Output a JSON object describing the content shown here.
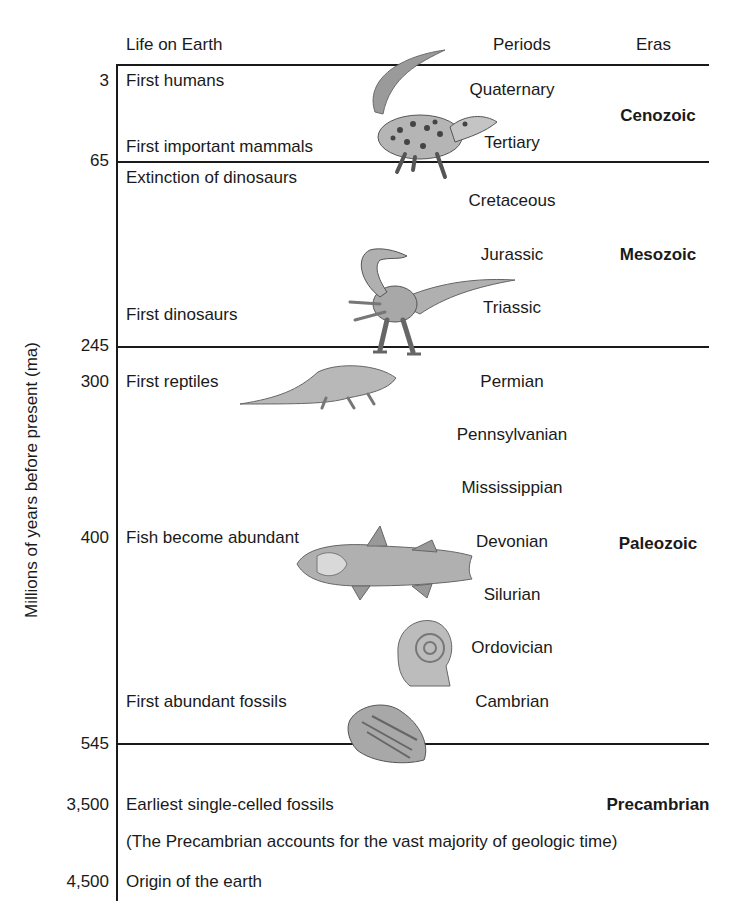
{
  "headers": {
    "life": "Life on Earth",
    "periods": "Periods",
    "eras": "Eras"
  },
  "y_axis_label": "Millions of years before present (ma)",
  "axis_ticks": [
    "3",
    "65",
    "245",
    "300",
    "400",
    "545",
    "3,500",
    "4,500"
  ],
  "events": [
    {
      "ma": "3",
      "label": "First humans"
    },
    {
      "ma": "65",
      "label": "First important mammals"
    },
    {
      "ma": "65",
      "label": "Extinction of dinosaurs"
    },
    {
      "ma": "245",
      "label": "First dinosaurs"
    },
    {
      "ma": "300",
      "label": "First reptiles"
    },
    {
      "ma": "400",
      "label": "Fish become abundant"
    },
    {
      "ma": "545",
      "label": "First abundant fossils"
    },
    {
      "ma": "3,500",
      "label": "Earliest single-celled fossils"
    },
    {
      "ma": "",
      "label": "(The Precambrian accounts for the vast majority of geologic time)"
    },
    {
      "ma": "4,500",
      "label": "Origin of the earth"
    }
  ],
  "periods": [
    "Quaternary",
    "Tertiary",
    "Cretaceous",
    "Jurassic",
    "Triassic",
    "Permian",
    "Pennsylvanian",
    "Mississippian",
    "Devonian",
    "Silurian",
    "Ordovician",
    "Cambrian"
  ],
  "eras": [
    "Cenozoic",
    "Mesozoic",
    "Paleozoic",
    "Precambrian"
  ],
  "illustrations": [
    "mammal-illustration",
    "dinosaur-illustration",
    "reptile-illustration",
    "fish-illustration",
    "ammonite-illustration",
    "trilobite-illustration"
  ],
  "colors": {
    "ink": "#1a1a1a",
    "illustration": "#8a8a8a",
    "background": "#ffffff"
  }
}
